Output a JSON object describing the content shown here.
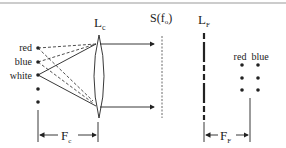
{
  "diagram": {
    "lens_collimator": {
      "label": "L",
      "subscript": "c"
    },
    "focal_plane": {
      "label": "S(f",
      "subscript": "o",
      "suffix": ")"
    },
    "lens_fourier": {
      "label": "L",
      "subscript": "F"
    },
    "source_labels": [
      "red",
      "blue",
      "white"
    ],
    "output_labels": [
      "red",
      "blue"
    ],
    "dim_collimator": {
      "label": "F",
      "subscript": "c"
    },
    "dim_fourier": {
      "label": "F",
      "subscript": "F"
    },
    "colors": {
      "line": "#222222",
      "border": "#999999",
      "background": "#ffffff"
    }
  }
}
